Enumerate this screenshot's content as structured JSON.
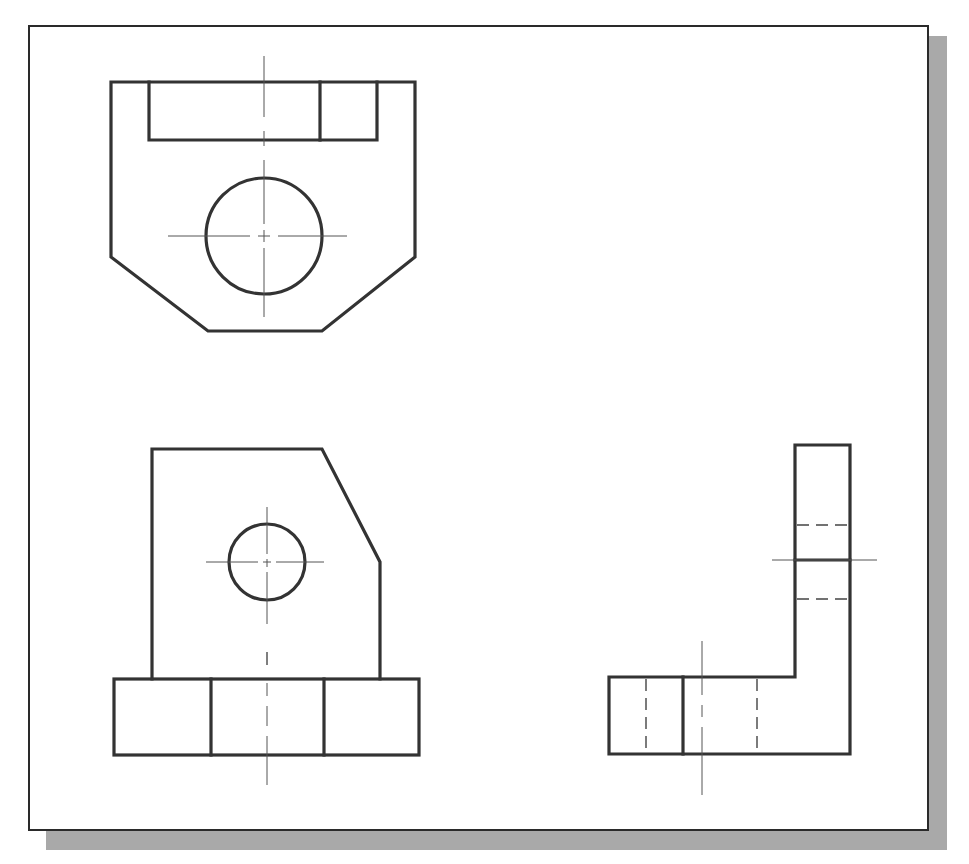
{
  "drawing": {
    "type": "orthographic-multiview",
    "views": [
      {
        "name": "top-view",
        "features": [
          "outer-profile-with-chamfers",
          "rectangular-slot",
          "slot-divider",
          "through-hole",
          "center-lines"
        ]
      },
      {
        "name": "front-view",
        "features": [
          "upright-with-angled-edge",
          "hole",
          "base-block",
          "base-dividers",
          "center-line"
        ]
      },
      {
        "name": "right-side-view",
        "features": [
          "L-profile",
          "hidden-lines-upright",
          "hidden-lines-base",
          "base-divider",
          "center-lines"
        ]
      }
    ],
    "colors": {
      "object_line": "#333333",
      "center_line": "#555555",
      "hidden_line": "#444444",
      "border": "#2a2a2a",
      "shadow": "#a9a9a9",
      "background": "#ffffff"
    }
  }
}
